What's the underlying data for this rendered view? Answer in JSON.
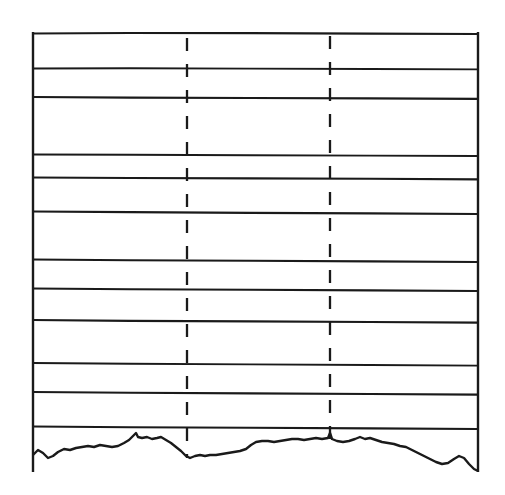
{
  "figure": {
    "style": "scanned line drawing, monochrome ink on white",
    "background_color": "#ffffff",
    "ink_color": "#1a1a1a",
    "width": 505,
    "height": 495
  },
  "chart_data": {
    "type": "line",
    "subtitle": "",
    "xlabel": "",
    "ylabel": "",
    "xlim": [
      33,
      478
    ],
    "ylim": [
      33,
      468
    ],
    "grid": false,
    "legend_position": "none",
    "tick_labels": {
      "x": [],
      "y": []
    },
    "annotations": [],
    "frame": {
      "name": "outer-frame",
      "left": 33,
      "top": 33,
      "right": 478,
      "bottom": 468,
      "stroke_width": 2.4
    },
    "series": [
      {
        "name": "horizon-01",
        "kind": "horizontal-boundary",
        "stroke_width": 2.2,
        "points": [
          [
            33,
            33.5
          ],
          [
            130,
            33.0
          ],
          [
            250,
            33.2
          ],
          [
            370,
            33.6
          ],
          [
            478,
            34.0
          ]
        ]
      },
      {
        "name": "horizon-02",
        "kind": "horizontal-boundary",
        "stroke_width": 1.9,
        "points": [
          [
            33,
            68.5
          ],
          [
            130,
            68.2
          ],
          [
            250,
            68.6
          ],
          [
            370,
            69.0
          ],
          [
            478,
            69.4
          ]
        ]
      },
      {
        "name": "horizon-03",
        "kind": "horizontal-boundary",
        "stroke_width": 2.2,
        "points": [
          [
            33,
            97.0
          ],
          [
            130,
            97.6
          ],
          [
            250,
            98.0
          ],
          [
            370,
            98.4
          ],
          [
            478,
            98.8
          ]
        ]
      },
      {
        "name": "horizon-04",
        "kind": "horizontal-boundary",
        "stroke_width": 1.9,
        "points": [
          [
            33,
            154.5
          ],
          [
            130,
            154.8
          ],
          [
            250,
            155.2
          ],
          [
            370,
            155.6
          ],
          [
            478,
            156.0
          ]
        ]
      },
      {
        "name": "horizon-05",
        "kind": "horizontal-boundary",
        "stroke_width": 2.1,
        "points": [
          [
            33,
            177.5
          ],
          [
            130,
            178.0
          ],
          [
            250,
            178.4
          ],
          [
            370,
            178.8
          ],
          [
            478,
            179.4
          ]
        ]
      },
      {
        "name": "horizon-06",
        "kind": "horizontal-boundary",
        "stroke_width": 2.2,
        "points": [
          [
            33,
            211.5
          ],
          [
            130,
            212.2
          ],
          [
            250,
            212.8
          ],
          [
            370,
            213.4
          ],
          [
            478,
            214.0
          ]
        ]
      },
      {
        "name": "horizon-07",
        "kind": "horizontal-boundary",
        "stroke_width": 2.1,
        "points": [
          [
            33,
            259.5
          ],
          [
            130,
            260.2
          ],
          [
            250,
            260.8
          ],
          [
            370,
            261.4
          ],
          [
            478,
            262.0
          ]
        ]
      },
      {
        "name": "horizon-08",
        "kind": "horizontal-boundary",
        "stroke_width": 2.1,
        "points": [
          [
            33,
            288.5
          ],
          [
            130,
            289.2
          ],
          [
            250,
            289.8
          ],
          [
            370,
            290.4
          ],
          [
            478,
            291.0
          ]
        ]
      },
      {
        "name": "horizon-09",
        "kind": "horizontal-boundary",
        "stroke_width": 2.2,
        "points": [
          [
            33,
            320.0
          ],
          [
            130,
            320.8
          ],
          [
            250,
            321.4
          ],
          [
            370,
            322.0
          ],
          [
            478,
            322.6
          ]
        ]
      },
      {
        "name": "horizon-10",
        "kind": "horizontal-boundary",
        "stroke_width": 1.9,
        "points": [
          [
            33,
            363.0
          ],
          [
            130,
            363.8
          ],
          [
            250,
            364.4
          ],
          [
            370,
            365.0
          ],
          [
            478,
            365.6
          ]
        ]
      },
      {
        "name": "horizon-11",
        "kind": "horizontal-boundary",
        "stroke_width": 2.1,
        "points": [
          [
            33,
            392.0
          ],
          [
            130,
            392.8
          ],
          [
            250,
            393.4
          ],
          [
            370,
            394.0
          ],
          [
            478,
            394.6
          ]
        ]
      },
      {
        "name": "horizon-12",
        "kind": "horizontal-boundary",
        "stroke_width": 2.1,
        "points": [
          [
            33,
            426.5
          ],
          [
            130,
            427.2
          ],
          [
            250,
            427.8
          ],
          [
            370,
            428.4
          ],
          [
            478,
            429.0
          ]
        ]
      },
      {
        "name": "terrain-surface-profile",
        "kind": "topographic-profile",
        "stroke_width": 2.4,
        "points": [
          [
            33,
            455
          ],
          [
            38,
            450
          ],
          [
            43,
            453
          ],
          [
            48,
            458
          ],
          [
            53,
            456
          ],
          [
            58,
            452
          ],
          [
            64,
            449
          ],
          [
            70,
            450
          ],
          [
            76,
            448
          ],
          [
            82,
            447
          ],
          [
            88,
            446
          ],
          [
            94,
            447
          ],
          [
            100,
            445
          ],
          [
            106,
            446
          ],
          [
            112,
            447
          ],
          [
            118,
            446
          ],
          [
            124,
            443
          ],
          [
            129,
            440
          ],
          [
            133,
            436
          ],
          [
            136,
            433
          ],
          [
            138,
            437
          ],
          [
            142,
            438
          ],
          [
            147,
            437
          ],
          [
            152,
            439
          ],
          [
            157,
            438
          ],
          [
            161,
            437
          ],
          [
            166,
            440
          ],
          [
            171,
            443
          ],
          [
            176,
            447
          ],
          [
            181,
            451
          ],
          [
            186,
            456
          ],
          [
            190,
            458
          ],
          [
            195,
            456
          ],
          [
            200,
            455
          ],
          [
            205,
            456
          ],
          [
            210,
            455
          ],
          [
            216,
            455
          ],
          [
            222,
            454
          ],
          [
            228,
            453
          ],
          [
            234,
            452
          ],
          [
            240,
            451
          ],
          [
            246,
            449
          ],
          [
            251,
            445
          ],
          [
            256,
            442
          ],
          [
            262,
            441
          ],
          [
            268,
            441
          ],
          [
            274,
            442
          ],
          [
            280,
            441
          ],
          [
            286,
            440
          ],
          [
            292,
            439
          ],
          [
            298,
            439
          ],
          [
            304,
            440
          ],
          [
            310,
            439
          ],
          [
            316,
            438
          ],
          [
            322,
            439
          ],
          [
            328,
            438
          ],
          [
            330,
            433
          ],
          [
            332,
            439
          ],
          [
            337,
            441
          ],
          [
            343,
            442
          ],
          [
            349,
            441
          ],
          [
            355,
            439
          ],
          [
            360,
            437
          ],
          [
            365,
            439
          ],
          [
            370,
            438
          ],
          [
            376,
            440
          ],
          [
            382,
            442
          ],
          [
            388,
            443
          ],
          [
            394,
            444
          ],
          [
            400,
            446
          ],
          [
            406,
            447
          ],
          [
            412,
            450
          ],
          [
            418,
            453
          ],
          [
            424,
            456
          ],
          [
            430,
            459
          ],
          [
            436,
            462
          ],
          [
            442,
            464
          ],
          [
            448,
            463
          ],
          [
            454,
            459
          ],
          [
            459,
            456
          ],
          [
            464,
            458
          ],
          [
            469,
            464
          ],
          [
            474,
            469
          ],
          [
            478,
            471
          ]
        ]
      }
    ],
    "dashed_verticals": [
      {
        "name": "vertical-marker-left",
        "x": 187,
        "y_top": 38,
        "y_bottom": 458,
        "stroke_width": 2.3,
        "dash_pattern": "13 13"
      },
      {
        "name": "vertical-marker-right",
        "x": 330,
        "y_top": 36,
        "y_bottom": 440,
        "stroke_width": 2.3,
        "dash_pattern": "13 13"
      }
    ]
  }
}
